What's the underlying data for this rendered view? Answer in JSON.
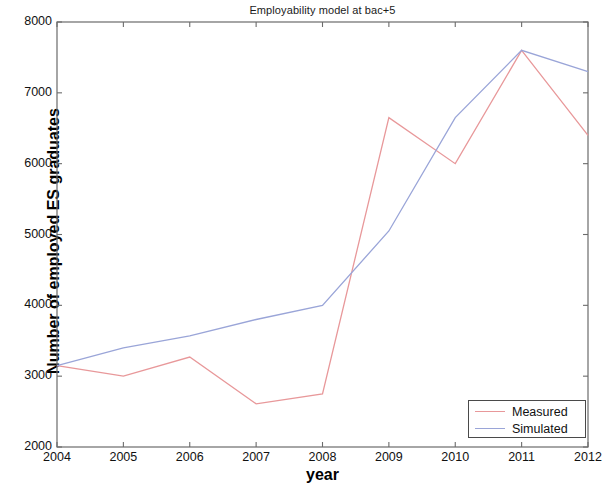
{
  "chart_data": {
    "type": "line",
    "title": "Employability model at bac+5",
    "xlabel": "year",
    "ylabel": "Number of employed ES graduates",
    "x": [
      2004,
      2005,
      2006,
      2007,
      2008,
      2009,
      2010,
      2011,
      2012
    ],
    "xtick_labels": [
      "2004",
      "2005",
      "2006",
      "2007",
      "2008",
      "2009",
      "2010",
      "2011",
      "2012"
    ],
    "ytick_labels": [
      "2000",
      "3000",
      "4000",
      "5000",
      "6000",
      "7000",
      "8000"
    ],
    "yticks": [
      2000,
      3000,
      4000,
      5000,
      6000,
      7000,
      8000
    ],
    "xlim": [
      2004,
      2012
    ],
    "ylim": [
      2000,
      8000
    ],
    "grid": false,
    "legend_position": "lower right",
    "series": [
      {
        "name": "Measured",
        "color": "#e8989a",
        "values": [
          3150,
          3000,
          3270,
          2610,
          2750,
          6650,
          6000,
          7600,
          6400
        ]
      },
      {
        "name": "Simulated",
        "color": "#9aa5d8",
        "values": [
          3150,
          3400,
          3570,
          3800,
          4000,
          5050,
          6650,
          7600,
          7300
        ]
      }
    ]
  },
  "legend": {
    "entries": [
      {
        "label": "Measured",
        "color": "#e8989a"
      },
      {
        "label": "Simulated",
        "color": "#9aa5d8"
      }
    ]
  },
  "axes": {
    "frame_color": "#6b6b6b"
  }
}
